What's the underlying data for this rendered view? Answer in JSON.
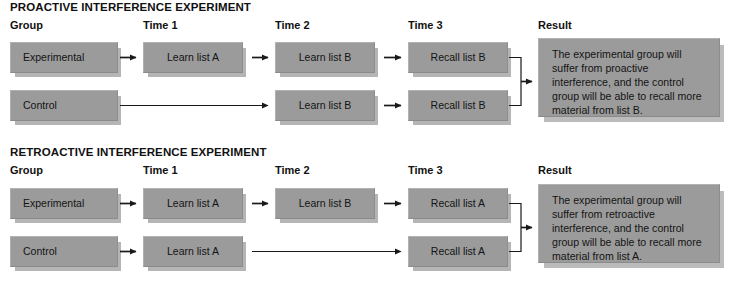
{
  "colors": {
    "box_fill": "#9b9b9b",
    "box_shadow": "#8a8a8a",
    "text": "#141414",
    "line": "#1a1a1a",
    "background": "#ffffff"
  },
  "experiments": [
    {
      "id": "proactive",
      "title": "PROACTIVE INTERFERENCE EXPERIMENT",
      "columns": [
        {
          "label": "Group"
        },
        {
          "label": "Time 1"
        },
        {
          "label": "Time 2"
        },
        {
          "label": "Time 3"
        },
        {
          "label": "Result"
        }
      ],
      "rows": [
        {
          "group": "Experimental",
          "time1": "Learn list A",
          "time2": "Learn list B",
          "time3": "Recall list B"
        },
        {
          "group": "Control",
          "time1": "",
          "time2": "Learn list B",
          "time3": "Recall list B"
        }
      ],
      "result": "The experimental group will suffer from proactive interference, and the control group will be able to recall more material from list B."
    },
    {
      "id": "retroactive",
      "title": "RETROACTIVE INTERFERENCE EXPERIMENT",
      "columns": [
        {
          "label": "Group"
        },
        {
          "label": "Time 1"
        },
        {
          "label": "Time 2"
        },
        {
          "label": "Time 3"
        },
        {
          "label": "Result"
        }
      ],
      "rows": [
        {
          "group": "Experimental",
          "time1": "Learn list A",
          "time2": "Learn list B",
          "time3": "Recall list A"
        },
        {
          "group": "Control",
          "time1": "Learn list A",
          "time2": "",
          "time3": "Recall list A"
        }
      ],
      "result": "The experimental group will suffer from retroactive interference, and the control group will be able to recall more material from list A."
    }
  ]
}
